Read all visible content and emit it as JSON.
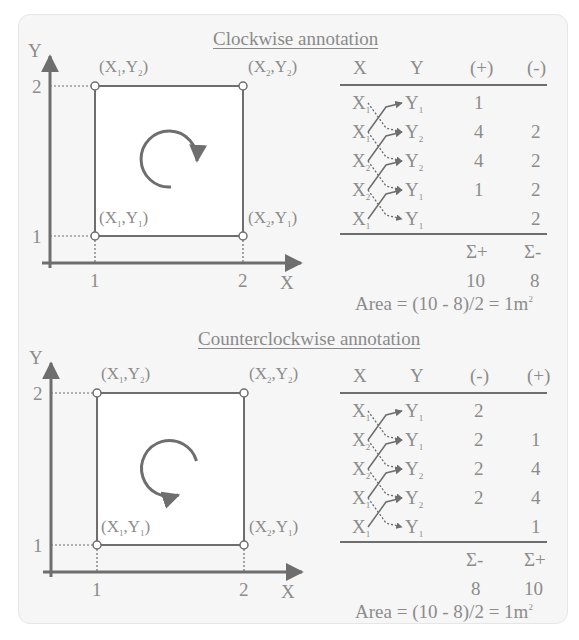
{
  "panels": [
    {
      "id": "clockwise",
      "title": "Clockwise annotation",
      "rotation": "clockwise",
      "axes": {
        "x_label": "X",
        "y_label": "Y",
        "x_ticks": [
          "1",
          "2"
        ],
        "y_ticks": [
          "1",
          "2"
        ]
      },
      "points": [
        {
          "label_x": "X",
          "sub_x": "1",
          "label_y": "Y",
          "sub_y": "2",
          "pos": "top-left"
        },
        {
          "label_x": "X",
          "sub_x": "2",
          "label_y": "Y",
          "sub_y": "2",
          "pos": "top-right"
        },
        {
          "label_x": "X",
          "sub_x": "1",
          "label_y": "Y",
          "sub_y": "1",
          "pos": "bottom-left"
        },
        {
          "label_x": "X",
          "sub_x": "2",
          "label_y": "Y",
          "sub_y": "1",
          "pos": "bottom-right"
        }
      ],
      "table": {
        "headers": [
          "X",
          "Y",
          "(+)",
          "(-)"
        ],
        "rows": [
          {
            "x": "1",
            "y": "1",
            "c3": "1",
            "c4": ""
          },
          {
            "x": "1",
            "y": "2",
            "c3": "4",
            "c4": "2"
          },
          {
            "x": "2",
            "y": "2",
            "c3": "4",
            "c4": "2"
          },
          {
            "x": "2",
            "y": "1",
            "c3": "1",
            "c4": "2"
          },
          {
            "x": "1",
            "y": "1",
            "c3": "",
            "c4": "2"
          }
        ],
        "sum_labels": [
          "Σ+",
          "Σ-"
        ],
        "sum_values": [
          "10",
          "8"
        ]
      },
      "area_text": "Area = (10 - 8)/2 = 1m",
      "area_sup": "2"
    },
    {
      "id": "counterclockwise",
      "title": "Counterclockwise annotation",
      "rotation": "counterclockwise",
      "axes": {
        "x_label": "X",
        "y_label": "Y",
        "x_ticks": [
          "1",
          "2"
        ],
        "y_ticks": [
          "1",
          "2"
        ]
      },
      "points": [
        {
          "label_x": "X",
          "sub_x": "1",
          "label_y": "Y",
          "sub_y": "2",
          "pos": "top-left"
        },
        {
          "label_x": "X",
          "sub_x": "2",
          "label_y": "Y",
          "sub_y": "2",
          "pos": "top-right"
        },
        {
          "label_x": "X",
          "sub_x": "1",
          "label_y": "Y",
          "sub_y": "1",
          "pos": "bottom-left"
        },
        {
          "label_x": "X",
          "sub_x": "2",
          "label_y": "Y",
          "sub_y": "1",
          "pos": "bottom-right"
        }
      ],
      "table": {
        "headers": [
          "X",
          "Y",
          "(-)",
          "(+)"
        ],
        "rows": [
          {
            "x": "1",
            "y": "1",
            "c3": "2",
            "c4": ""
          },
          {
            "x": "2",
            "y": "1",
            "c3": "2",
            "c4": "1"
          },
          {
            "x": "2",
            "y": "2",
            "c3": "2",
            "c4": "4"
          },
          {
            "x": "1",
            "y": "2",
            "c3": "2",
            "c4": "4"
          },
          {
            "x": "1",
            "y": "1",
            "c3": "",
            "c4": "1"
          }
        ],
        "sum_labels": [
          "Σ-",
          "Σ+"
        ],
        "sum_values": [
          "8",
          "10"
        ]
      },
      "area_text": "Area = (10 - 8)/2 = 1m",
      "area_sup": "2"
    }
  ],
  "colors": {
    "line": "#6e6e6e",
    "text": "#8c8c8c",
    "card": "#f6f6f6",
    "square_fill": "#ffffff"
  }
}
